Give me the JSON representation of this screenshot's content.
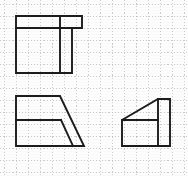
{
  "sheet": {
    "title": "Orthographic Projection Worksheet",
    "width": 188,
    "height": 176,
    "background_color": "#fdfdfd",
    "line_color": "#1c1c1c",
    "grid_color": "#b8b8b8"
  },
  "grid": {
    "name": "dotted-graph-grid",
    "cell_size": 12.0,
    "origin_x": 4.0,
    "origin_y": 4.0,
    "columns": 15,
    "rows": 14,
    "style": "dotted",
    "visible": true
  },
  "views": [
    {
      "id": "top-view",
      "label": "Top View",
      "description": "L-shaped plan outline: wide upper band over a large left block with a narrow notch at the right",
      "outline": "16,16 82,16 82,28 72,28 72,73 16,73",
      "inner_lines": [
        "16,28 72,28",
        "60,16 60,73"
      ]
    },
    {
      "id": "front-view",
      "label": "Front View",
      "description": "Rectangle with a slanted right edge and an inner parallel slant forming a thin web",
      "outline": "16,96 60,96 84,146 16,146",
      "inner_lines": [
        "16,120 61,120",
        "61,120 73,146"
      ]
    },
    {
      "id": "side-view",
      "label": "Side View",
      "description": "Stepped profile: low left block rising by a diagonal to a tall right column",
      "outline": "122,120 158,99 170,99 170,146 122,146",
      "inner_lines": [
        "122,120 158,120",
        "158,99 158,146"
      ]
    }
  ]
}
